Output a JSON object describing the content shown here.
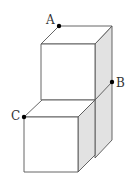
{
  "diagram": {
    "type": "stacked-cubes",
    "colors": {
      "stroke": "#555555",
      "shade": "#e2e2e2",
      "face": "#ffffff",
      "point": "#000000"
    },
    "points": [
      {
        "id": "A",
        "label": "A",
        "x": 59,
        "y": 26
      },
      {
        "id": "B",
        "label": "B",
        "x": 112,
        "y": 82
      },
      {
        "id": "C",
        "label": "C",
        "x": 24,
        "y": 117
      }
    ]
  }
}
